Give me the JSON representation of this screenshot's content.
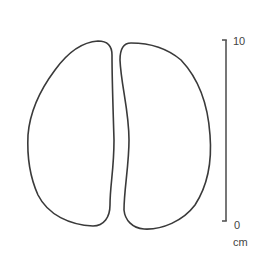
{
  "figure": {
    "outline_color": "#3a3a3a",
    "shapes": [
      {
        "name": "left-outline"
      },
      {
        "name": "right-outline"
      }
    ],
    "scale_bar": {
      "top_label": "10",
      "bottom_label": "0",
      "unit": "cm",
      "color": "#555555"
    }
  }
}
